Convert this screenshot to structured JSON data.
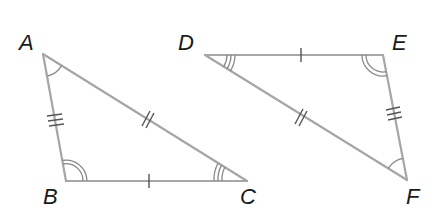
{
  "figure": {
    "colors": {
      "edge": "#a6a6a6",
      "tick": "#555555",
      "label": "#1a1a1a",
      "background": "#ffffff"
    }
  },
  "triangle_abc": {
    "vertices": {
      "A": {
        "label": "A",
        "x": 43,
        "y": 54
      },
      "B": {
        "label": "B",
        "x": 66,
        "y": 181
      },
      "C": {
        "label": "C",
        "x": 247,
        "y": 181
      }
    },
    "sides": [
      {
        "name": "AB",
        "tick_marks": 3
      },
      {
        "name": "AC",
        "tick_marks": 2
      },
      {
        "name": "BC",
        "tick_marks": 1
      }
    ],
    "angles": [
      {
        "vertex": "A",
        "arcs": 1
      },
      {
        "vertex": "B",
        "arcs": 2
      },
      {
        "vertex": "C",
        "arcs": 3
      }
    ]
  },
  "triangle_def": {
    "vertices": {
      "D": {
        "label": "D",
        "x": 205,
        "y": 55
      },
      "E": {
        "label": "E",
        "x": 383,
        "y": 55
      },
      "F": {
        "label": "F",
        "x": 407,
        "y": 180
      }
    },
    "sides": [
      {
        "name": "DE",
        "tick_marks": 1
      },
      {
        "name": "DF",
        "tick_marks": 2
      },
      {
        "name": "EF",
        "tick_marks": 3
      }
    ],
    "angles": [
      {
        "vertex": "D",
        "arcs": 3
      },
      {
        "vertex": "E",
        "arcs": 2
      },
      {
        "vertex": "F",
        "arcs": 1
      }
    ]
  }
}
